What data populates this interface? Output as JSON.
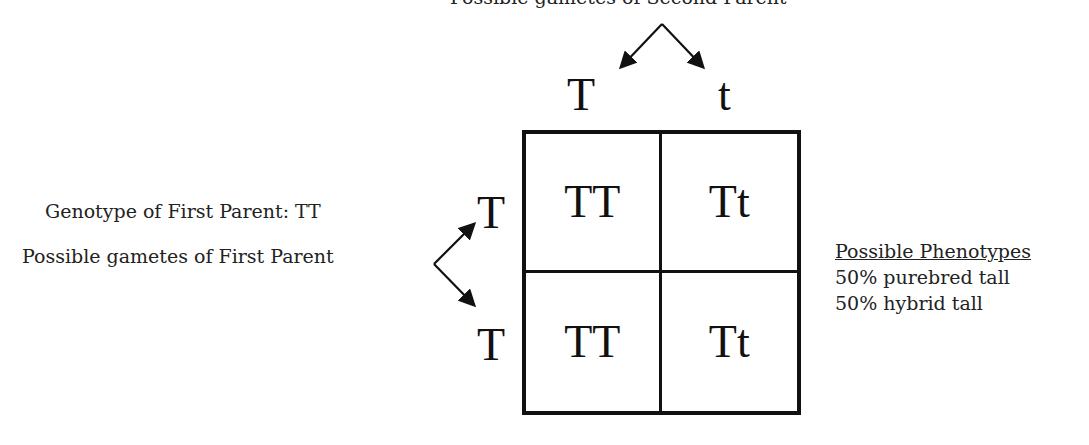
{
  "second_parent": {
    "gametes_label": "Possible gametes of Second Parent",
    "gametes": [
      "T",
      "t"
    ]
  },
  "first_parent": {
    "genotype_label": "Genotype of First Parent: TT",
    "gametes_label": "Possible gametes of First Parent",
    "gametes": [
      "T",
      "T"
    ]
  },
  "punnett": {
    "rows": [
      [
        "TT",
        "Tt"
      ],
      [
        "TT",
        "Tt"
      ]
    ]
  },
  "phenotypes": {
    "title": "Possible Phenotypes",
    "items": [
      "50% purebred tall",
      "50% hybrid tall"
    ]
  }
}
